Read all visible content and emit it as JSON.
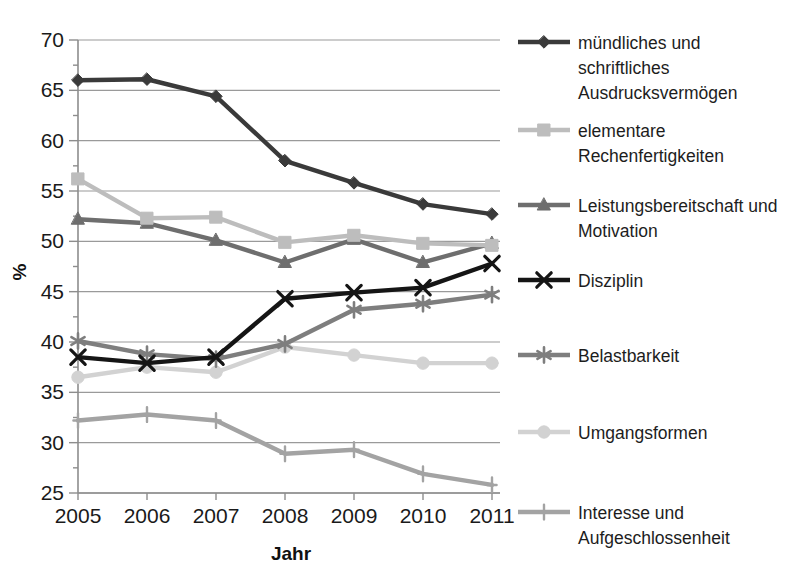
{
  "chart_data": {
    "type": "line",
    "title": "",
    "xlabel": "Jahr",
    "ylabel": "%",
    "x": [
      "2005",
      "2006",
      "2007",
      "2008",
      "2009",
      "2010",
      "2011"
    ],
    "categories": [
      "2005",
      "2006",
      "2007",
      "2008",
      "2009",
      "2010",
      "2011"
    ],
    "ylim": [
      25,
      70
    ],
    "yticks": [
      "25",
      "30",
      "35",
      "40",
      "45",
      "50",
      "55",
      "60",
      "65",
      "70"
    ],
    "grid": true,
    "legend_position": "right",
    "series": [
      {
        "name": "mündliches und schriftliches Ausdrucksvermögen",
        "values": [
          66.0,
          66.1,
          64.4,
          58.0,
          55.8,
          53.7,
          52.7
        ],
        "color": "#3a3a3a",
        "marker": "diamond"
      },
      {
        "name": "elementare Rechenfertigkeiten",
        "values": [
          56.2,
          52.3,
          52.4,
          49.9,
          50.6,
          49.8,
          49.6
        ],
        "color": "#bdbdbd",
        "marker": "square"
      },
      {
        "name": "Leistungsbereitschaft und Motivation",
        "values": [
          52.2,
          51.8,
          50.1,
          47.9,
          50.2,
          47.9,
          49.8
        ],
        "color": "#6e6e6e",
        "marker": "triangle"
      },
      {
        "name": "Disziplin",
        "values": [
          38.5,
          37.9,
          38.5,
          44.3,
          44.9,
          45.4,
          47.8
        ],
        "color": "#151515",
        "marker": "x"
      },
      {
        "name": "Belastbarkeit",
        "values": [
          40.1,
          38.8,
          38.3,
          39.8,
          43.2,
          43.8,
          44.7
        ],
        "color": "#7e7e7e",
        "marker": "asterisk"
      },
      {
        "name": "Umgangsformen",
        "values": [
          36.5,
          37.5,
          37.0,
          39.5,
          38.7,
          37.9,
          37.9
        ],
        "color": "#d2d2d2",
        "marker": "circle"
      },
      {
        "name": "Interesse und Aufgeschlossenheit",
        "values": [
          32.2,
          32.8,
          32.2,
          28.9,
          29.3,
          26.9,
          25.8
        ],
        "color": "#a3a3a3",
        "marker": "plus"
      }
    ]
  },
  "legend": {
    "entries": [
      {
        "label_lines": [
          "mündliches und",
          "schriftliches",
          "Ausdrucksvermögen"
        ]
      },
      {
        "label_lines": [
          "elementare",
          "Rechenfertigkeiten"
        ]
      },
      {
        "label_lines": [
          "Leistungsbereitschaft und",
          "Motivation"
        ]
      },
      {
        "label_lines": [
          "Disziplin"
        ]
      },
      {
        "label_lines": [
          "Belastbarkeit"
        ]
      },
      {
        "label_lines": [
          "Umgangsformen"
        ]
      },
      {
        "label_lines": [
          "Interesse und",
          "Aufgeschlossenheit"
        ]
      }
    ]
  }
}
